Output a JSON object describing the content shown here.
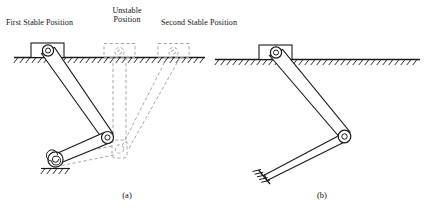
{
  "figure": {
    "type": "engineering-diagram",
    "labels": {
      "first_stable": "First Stable Position",
      "unstable_line1": "Unstable",
      "unstable_line2": "Position",
      "second_stable": "Second Stable Position"
    },
    "captions": {
      "a": "(a)",
      "b": "(b)"
    },
    "colors": {
      "line": "#1a1a1a",
      "ghost": "#9a9a9a",
      "background": "#ffffff"
    },
    "panel_a": {
      "ground_pivot_block": "slider-block-with-pin-joint",
      "joints": [
        "top-pin-joint",
        "middle-pin-joint",
        "spiral-torsion-spring-ground-joint"
      ],
      "ghost_positions": [
        "unstable-position",
        "second-stable-position"
      ],
      "spring": "spiral-torsional-spring"
    },
    "panel_b": {
      "ground_pivot_block": "slider-block-with-pin-joint",
      "joints": [
        "top-pin-joint",
        "elbow-pin-joint",
        "fixed-ground-support"
      ],
      "support": "hatched-fixed-support"
    }
  }
}
